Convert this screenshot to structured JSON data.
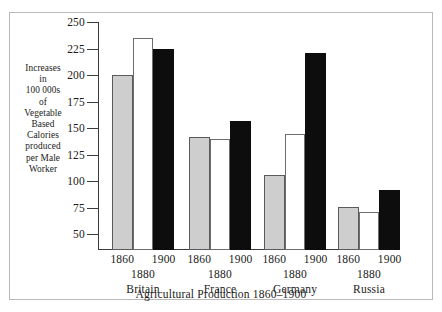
{
  "chart_data": {
    "type": "bar",
    "title": "",
    "caption": "Agricultural Production 1860–1900",
    "ylabel_lines": [
      "Increases",
      "in",
      "100 000s",
      "of",
      "Vegetable",
      "Based",
      "Calories",
      "produced",
      "per Male",
      "Worker"
    ],
    "xlabel": "Agricultural Production 1860–1900",
    "categories": [
      "Britain",
      "France",
      "Germany",
      "Russia"
    ],
    "series_labels": [
      "1860",
      "1880",
      "1900"
    ],
    "series": [
      {
        "name": "1860",
        "style": "gray",
        "values": [
          200,
          142,
          106,
          76
        ]
      },
      {
        "name": "1880",
        "style": "white",
        "values": [
          235,
          140,
          144,
          71
        ]
      },
      {
        "name": "1900",
        "style": "black",
        "values": [
          225,
          157,
          221,
          92
        ]
      }
    ],
    "yticks": [
      250,
      225,
      200,
      175,
      150,
      125,
      100,
      75,
      50
    ],
    "ylim": [
      35,
      250
    ],
    "grid": false,
    "legend": "none",
    "colors": {
      "gray_bar": "#cecece",
      "white_bar": "#ffffff",
      "black_bar": "#0d0d0d",
      "axis": "#3b3b3b",
      "text": "#1a1a1a",
      "frame": "#b9b9b9"
    }
  }
}
